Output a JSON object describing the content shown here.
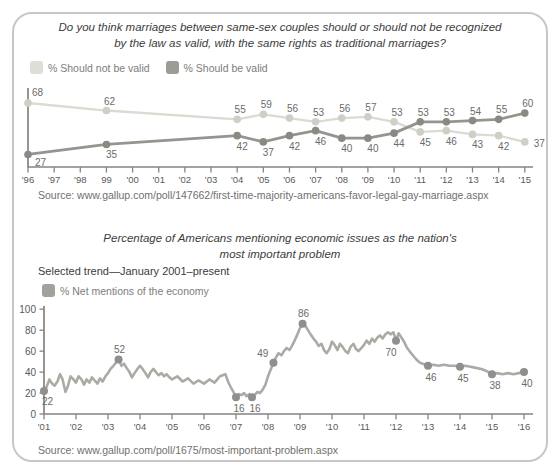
{
  "colors": {
    "card_border": "#c7c7c7",
    "axis": "#848484",
    "tick_label": "#5a5a5a",
    "data_label": "#6b6b6b",
    "title": "#3c3c3c",
    "source": "#6f6f6f",
    "legend_text": "#7d7d7d"
  },
  "chart_data": [
    {
      "type": "line",
      "title_lines": [
        "Do you think marriages between same-sex couples should or should not be recognized",
        "by the law as valid, with the same rights as traditional marriages?"
      ],
      "x_tick_labels": [
        "'96",
        "'97",
        "'98",
        "99",
        "'00",
        "'01",
        "'02",
        "'03",
        "'04",
        "'05",
        "'06",
        "'07",
        "'08",
        "'09",
        "'10",
        "'11",
        "'12",
        "'13",
        "'14",
        "'15"
      ],
      "ylim": [
        17,
        80
      ],
      "series": [
        {
          "name": "% Should not be valid",
          "line_color": "#dbdbd3",
          "dot_color": "#cfcfc7",
          "swatch_color": "#deded6",
          "points": [
            {
              "i": 0,
              "year": "'96",
              "v": 68,
              "label_pos": "above-start"
            },
            {
              "i": 3,
              "year": "'99",
              "v": 62,
              "label_pos": "above"
            },
            {
              "i": 8,
              "year": "'04",
              "v": 55,
              "label_pos": "above"
            },
            {
              "i": 9,
              "year": "'05",
              "v": 59,
              "label_pos": "above"
            },
            {
              "i": 10,
              "year": "'06",
              "v": 56,
              "label_pos": "above"
            },
            {
              "i": 11,
              "year": "'07",
              "v": 53,
              "label_pos": "above"
            },
            {
              "i": 12,
              "year": "'08",
              "v": 56,
              "label_pos": "above"
            },
            {
              "i": 13,
              "year": "'09",
              "v": 57,
              "label_pos": "above"
            },
            {
              "i": 14,
              "year": "'10",
              "v": 53,
              "label_pos": "above"
            },
            {
              "i": 15,
              "year": "'11",
              "v": 45,
              "label_pos": "below"
            },
            {
              "i": 16,
              "year": "'12",
              "v": 46,
              "label_pos": "below"
            },
            {
              "i": 17,
              "year": "'13",
              "v": 43,
              "label_pos": "below"
            },
            {
              "i": 18,
              "year": "'14",
              "v": 42,
              "label_pos": "below"
            },
            {
              "i": 19,
              "year": "'15",
              "v": 37,
              "label_pos": "right"
            }
          ]
        },
        {
          "name": "% Should be valid",
          "line_color": "#95958f",
          "dot_color": "#8a8a84",
          "swatch_color": "#9c9c96",
          "points": [
            {
              "i": 0,
              "year": "'96",
              "v": 27,
              "label_pos": "below-start"
            },
            {
              "i": 3,
              "year": "'99",
              "v": 35,
              "label_pos": "below"
            },
            {
              "i": 8,
              "year": "'04",
              "v": 42,
              "label_pos": "below"
            },
            {
              "i": 9,
              "year": "'05",
              "v": 37,
              "label_pos": "below"
            },
            {
              "i": 10,
              "year": "'06",
              "v": 42,
              "label_pos": "below"
            },
            {
              "i": 11,
              "year": "'07",
              "v": 46,
              "label_pos": "below"
            },
            {
              "i": 12,
              "year": "'08",
              "v": 40,
              "label_pos": "below"
            },
            {
              "i": 13,
              "year": "'09",
              "v": 40,
              "label_pos": "below"
            },
            {
              "i": 14,
              "year": "'10",
              "v": 44,
              "label_pos": "below"
            },
            {
              "i": 15,
              "year": "'11",
              "v": 53,
              "label_pos": "above"
            },
            {
              "i": 16,
              "year": "'12",
              "v": 53,
              "label_pos": "above"
            },
            {
              "i": 17,
              "year": "'13",
              "v": 54,
              "label_pos": "above"
            },
            {
              "i": 18,
              "year": "'14",
              "v": 55,
              "label_pos": "above"
            },
            {
              "i": 19,
              "year": "'15",
              "v": 60,
              "label_pos": "above"
            }
          ]
        }
      ],
      "source_text": "Source: www.gallup.com/poll/147662/first-time-majority-americans-favor-legal-gay-marriage.aspx"
    },
    {
      "type": "line",
      "title_lines": [
        "Percentage of Americans mentioning economic issues as the nation's",
        "most important problem"
      ],
      "subtitle": "Selected trend—January 2001–present",
      "legend_label": "% Net mentions of the economy",
      "legend_swatch_color": "#a2a29c",
      "line_color": "#ababa5",
      "dot_color": "#8f8f8f",
      "ylim": [
        0,
        100
      ],
      "y_ticks": [
        0,
        20,
        40,
        60,
        80,
        100
      ],
      "x_tick_labels": [
        "'01",
        "'02",
        "'03",
        "'04",
        "'05",
        "'06",
        "'07",
        "'08",
        "'09",
        "'10",
        "'11",
        "'12",
        "'13",
        "'14",
        "'15",
        "'16"
      ],
      "trend": [
        [
          2001.0,
          22
        ],
        [
          2001.08,
          26
        ],
        [
          2001.17,
          33
        ],
        [
          2001.25,
          29
        ],
        [
          2001.33,
          27
        ],
        [
          2001.42,
          31
        ],
        [
          2001.5,
          38
        ],
        [
          2001.58,
          33
        ],
        [
          2001.67,
          21
        ],
        [
          2001.75,
          27
        ],
        [
          2001.83,
          36
        ],
        [
          2001.92,
          33
        ],
        [
          2002.0,
          30
        ],
        [
          2002.08,
          36
        ],
        [
          2002.17,
          33
        ],
        [
          2002.25,
          28
        ],
        [
          2002.33,
          33
        ],
        [
          2002.42,
          30
        ],
        [
          2002.5,
          35
        ],
        [
          2002.58,
          32
        ],
        [
          2002.67,
          29
        ],
        [
          2002.75,
          34
        ],
        [
          2002.83,
          31
        ],
        [
          2002.92,
          36
        ],
        [
          2003.0,
          39
        ],
        [
          2003.08,
          43
        ],
        [
          2003.17,
          46
        ],
        [
          2003.25,
          49
        ],
        [
          2003.33,
          52
        ],
        [
          2003.42,
          46
        ],
        [
          2003.5,
          48
        ],
        [
          2003.58,
          44
        ],
        [
          2003.67,
          40
        ],
        [
          2003.75,
          35
        ],
        [
          2003.83,
          39
        ],
        [
          2003.92,
          43
        ],
        [
          2004.0,
          46
        ],
        [
          2004.08,
          43
        ],
        [
          2004.17,
          39
        ],
        [
          2004.25,
          35
        ],
        [
          2004.33,
          40
        ],
        [
          2004.42,
          43
        ],
        [
          2004.5,
          40
        ],
        [
          2004.58,
          37
        ],
        [
          2004.67,
          39
        ],
        [
          2004.75,
          36
        ],
        [
          2004.83,
          38
        ],
        [
          2004.92,
          35
        ],
        [
          2005.0,
          33
        ],
        [
          2005.17,
          36
        ],
        [
          2005.33,
          31
        ],
        [
          2005.5,
          34
        ],
        [
          2005.67,
          29
        ],
        [
          2005.83,
          32
        ],
        [
          2006.0,
          29
        ],
        [
          2006.17,
          33
        ],
        [
          2006.33,
          30
        ],
        [
          2006.5,
          36
        ],
        [
          2006.67,
          38
        ],
        [
          2006.75,
          31
        ],
        [
          2006.83,
          26
        ],
        [
          2006.92,
          21
        ],
        [
          2007.0,
          16
        ],
        [
          2007.08,
          19
        ],
        [
          2007.17,
          18
        ],
        [
          2007.25,
          20
        ],
        [
          2007.33,
          17
        ],
        [
          2007.42,
          19
        ],
        [
          2007.5,
          16
        ],
        [
          2007.58,
          18
        ],
        [
          2007.67,
          21
        ],
        [
          2007.75,
          20
        ],
        [
          2007.83,
          23
        ],
        [
          2007.92,
          28
        ],
        [
          2008.0,
          36
        ],
        [
          2008.17,
          49
        ],
        [
          2008.25,
          54
        ],
        [
          2008.33,
          58
        ],
        [
          2008.42,
          56
        ],
        [
          2008.5,
          60
        ],
        [
          2008.58,
          63
        ],
        [
          2008.67,
          61
        ],
        [
          2008.75,
          65
        ],
        [
          2008.83,
          70
        ],
        [
          2008.92,
          76
        ],
        [
          2009.0,
          82
        ],
        [
          2009.08,
          86
        ],
        [
          2009.17,
          84
        ],
        [
          2009.25,
          80
        ],
        [
          2009.33,
          76
        ],
        [
          2009.42,
          72
        ],
        [
          2009.5,
          69
        ],
        [
          2009.58,
          65
        ],
        [
          2009.67,
          67
        ],
        [
          2009.75,
          61
        ],
        [
          2009.83,
          58
        ],
        [
          2009.92,
          62
        ],
        [
          2010.0,
          69
        ],
        [
          2010.08,
          66
        ],
        [
          2010.17,
          61
        ],
        [
          2010.25,
          67
        ],
        [
          2010.33,
          64
        ],
        [
          2010.42,
          60
        ],
        [
          2010.5,
          58
        ],
        [
          2010.58,
          64
        ],
        [
          2010.67,
          67
        ],
        [
          2010.75,
          62
        ],
        [
          2010.83,
          60
        ],
        [
          2010.92,
          63
        ],
        [
          2011.0,
          66
        ],
        [
          2011.08,
          70
        ],
        [
          2011.17,
          67
        ],
        [
          2011.25,
          72
        ],
        [
          2011.33,
          69
        ],
        [
          2011.42,
          73
        ],
        [
          2011.5,
          75
        ],
        [
          2011.58,
          72
        ],
        [
          2011.67,
          76
        ],
        [
          2011.75,
          78
        ],
        [
          2011.83,
          76
        ],
        [
          2011.92,
          78
        ],
        [
          2012.0,
          70
        ],
        [
          2012.08,
          77
        ],
        [
          2012.17,
          73
        ],
        [
          2012.25,
          69
        ],
        [
          2012.33,
          64
        ],
        [
          2012.42,
          60
        ],
        [
          2012.5,
          57
        ],
        [
          2012.58,
          54
        ],
        [
          2012.67,
          51
        ],
        [
          2012.75,
          49
        ],
        [
          2012.83,
          48
        ],
        [
          2012.92,
          47
        ],
        [
          2013.0,
          46
        ],
        [
          2013.17,
          47
        ],
        [
          2013.33,
          46
        ],
        [
          2013.5,
          47
        ],
        [
          2013.67,
          46
        ],
        [
          2013.83,
          46
        ],
        [
          2014.0,
          45
        ],
        [
          2014.17,
          46
        ],
        [
          2014.33,
          45
        ],
        [
          2014.5,
          44
        ],
        [
          2014.67,
          43
        ],
        [
          2014.83,
          41
        ],
        [
          2015.0,
          38
        ],
        [
          2015.17,
          39
        ],
        [
          2015.33,
          38
        ],
        [
          2015.5,
          39
        ],
        [
          2015.67,
          38
        ],
        [
          2015.83,
          39
        ],
        [
          2016.0,
          40
        ]
      ],
      "labeled_points": [
        {
          "t": 2001.0,
          "v": 22,
          "label_pos": "below-start"
        },
        {
          "t": 2003.33,
          "v": 52,
          "label_pos": "above"
        },
        {
          "t": 2007.0,
          "v": 16,
          "label_pos": "below"
        },
        {
          "t": 2007.5,
          "v": 16,
          "label_pos": "below"
        },
        {
          "t": 2008.17,
          "v": 49,
          "label_pos": "above-end"
        },
        {
          "t": 2009.08,
          "v": 86,
          "label_pos": "above"
        },
        {
          "t": 2012.0,
          "v": 70,
          "label_pos": "below-left"
        },
        {
          "t": 2013.0,
          "v": 46,
          "label_pos": "below"
        },
        {
          "t": 2014.0,
          "v": 45,
          "label_pos": "below"
        },
        {
          "t": 2015.0,
          "v": 38,
          "label_pos": "below"
        },
        {
          "t": 2016.0,
          "v": 40,
          "label_pos": "below"
        }
      ],
      "source_text": "Source: www.gallup.com/poll/1675/most-important-problem.aspx"
    }
  ]
}
